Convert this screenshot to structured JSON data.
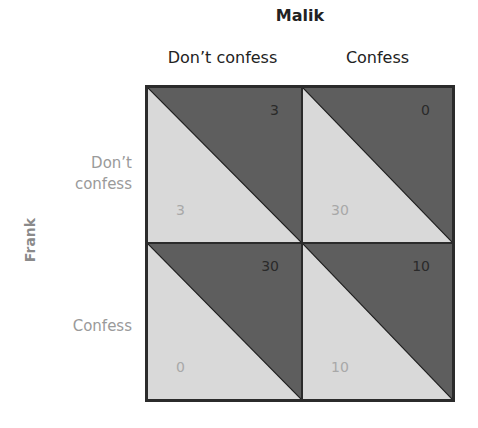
{
  "column_player": {
    "name": "Malik",
    "strategies": [
      "Don’t confess",
      "Confess"
    ]
  },
  "row_player": {
    "name": "Frank",
    "strategies": [
      "Don’t\nconfess",
      "Confess"
    ]
  },
  "colors": {
    "upper_triangle": "#5e5e5e",
    "lower_triangle": "#d9d9d9",
    "border": "#2b2b2b",
    "column_payoff_text": "#2a2a2a",
    "row_payoff_text": "#a8a8a8"
  },
  "cells": [
    {
      "row": "Don't confess",
      "col": "Don't confess",
      "malik": "3",
      "frank": "3"
    },
    {
      "row": "Don't confess",
      "col": "Confess",
      "malik": "0",
      "frank": "30"
    },
    {
      "row": "Confess",
      "col": "Don't confess",
      "malik": "30",
      "frank": "0"
    },
    {
      "row": "Confess",
      "col": "Confess",
      "malik": "10",
      "frank": "10"
    }
  ]
}
